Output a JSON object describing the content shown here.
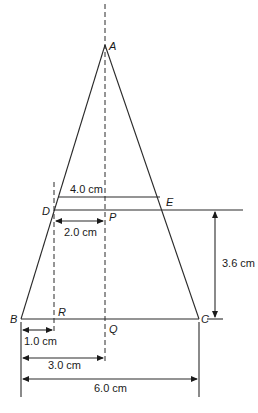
{
  "diagram": {
    "type": "geometry",
    "points": {
      "A": "A",
      "B": "B",
      "C": "C",
      "D": "D",
      "E": "E",
      "P": "P",
      "Q": "Q",
      "R": "R"
    },
    "dimensions": {
      "top_width": "4.0 cm",
      "dp_length": "2.0 cm",
      "height_de_to_bc": "3.6 cm",
      "br_length": "1.0 cm",
      "bq_length": "3.0 cm",
      "bc_length": "6.0 cm"
    }
  }
}
